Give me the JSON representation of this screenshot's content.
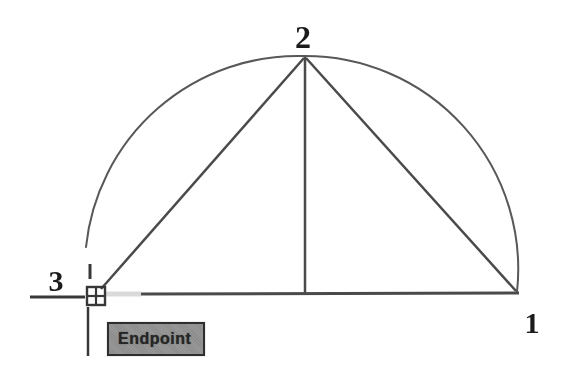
{
  "figure": {
    "background": "#ffffff"
  },
  "labels": {
    "point1": "1",
    "point2": "2",
    "point3": "3"
  },
  "tooltip": {
    "text": "Endpoint",
    "bg_color": "#949494",
    "border_color": "#2e2e2e",
    "text_color": "#262626"
  },
  "drawing": {
    "entity_color": "#4a4a4a",
    "arc_color": "#585858",
    "highlight_color": "#d9d9d9",
    "cursor_color": "#383838",
    "points": {
      "p1": {
        "label": "1",
        "x": 517,
        "y": 293
      },
      "p2": {
        "label": "2",
        "x": 305,
        "y": 56
      },
      "p3": {
        "label": "3",
        "x": 95,
        "y": 296
      }
    },
    "arc": {
      "name": "arc-entity",
      "path": "M 517 292 A 213 213 0 0 0 305 56 A 213 213 0 0 0 86 247",
      "width": 2,
      "color": "#585858",
      "interactable": "true"
    },
    "lines": [
      {
        "name": "baseline-entity",
        "x1": 141,
        "y1": 294,
        "x2": 519,
        "y2": 293,
        "width": 3,
        "color": "#4a4a4a",
        "interactable": "true"
      },
      {
        "name": "baseline-highlight-segment",
        "x1": 106,
        "y1": 294,
        "x2": 141,
        "y2": 294,
        "width": 5,
        "color": "#d9d9d9",
        "interactable": "false"
      },
      {
        "name": "vertical-line-entity",
        "x1": 305,
        "y1": 57,
        "x2": 305,
        "y2": 293,
        "width": 2.5,
        "color": "#4a4a4a",
        "interactable": "true"
      },
      {
        "name": "chord-line-2-3",
        "x1": 304,
        "y1": 58,
        "x2": 101,
        "y2": 289,
        "width": 2.5,
        "color": "#4a4a4a",
        "interactable": "true"
      },
      {
        "name": "chord-line-2-1",
        "x1": 306,
        "y1": 58,
        "x2": 516,
        "y2": 291,
        "width": 2.5,
        "color": "#4a4a4a",
        "interactable": "true"
      }
    ],
    "cursor": {
      "snap_mode": "Endpoint",
      "pickbox": {
        "x": 86,
        "y": 286,
        "size": 20,
        "width": 2.4
      },
      "arms": [
        {
          "name": "crosshair-left-arm",
          "x1": 30,
          "y1": 297,
          "x2": 85,
          "y2": 297,
          "width": 3
        },
        {
          "name": "crosshair-top-arm",
          "x1": 90,
          "y1": 264,
          "x2": 90,
          "y2": 279,
          "width": 3
        },
        {
          "name": "crosshair-bottom-arm",
          "x1": 88,
          "y1": 307,
          "x2": 88,
          "y2": 356,
          "width": 2.5
        }
      ]
    },
    "label_positions": {
      "point1": [
        532,
        333
      ],
      "point2": [
        303,
        48
      ],
      "point3": [
        56,
        291
      ]
    }
  }
}
